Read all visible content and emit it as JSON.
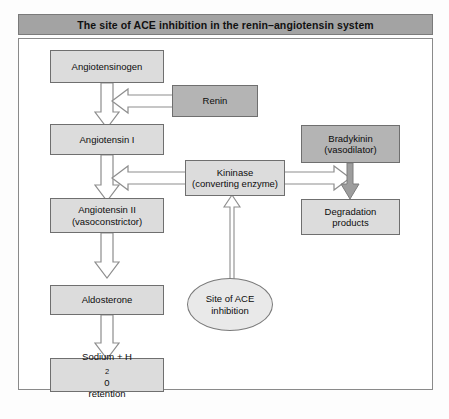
{
  "figure": {
    "title": "The site of ACE inhibition in the renin–angiotensin system",
    "colors": {
      "title_bar": "#a3a3a3",
      "node_light": "#dcdcdc",
      "node_dark": "#b4b4b4",
      "ellipse_fill": "#e9e9e9",
      "arrow_outline": "#8d8d8d",
      "arrow_fill": "#ffffff",
      "border": "#6f6f6f",
      "frame": "#8a8a8a",
      "text": "#0c0c0c"
    }
  },
  "nodes": {
    "angiotensinogen": {
      "label": "Angiotensinogen"
    },
    "renin": {
      "label": "Renin"
    },
    "angiotensin_i": {
      "label": "Angiotensin I"
    },
    "kininase": {
      "line1": "Kininase",
      "line2": "(converting enzyme)"
    },
    "bradykinin": {
      "line1": "Bradykinin",
      "line2": "(vasodilator)"
    },
    "angiotensin_ii": {
      "line1": "Angiotensin II",
      "line2": "(vasoconstrictor)"
    },
    "degradation_products": {
      "line1": "Degradation",
      "line2": "products"
    },
    "aldosterone": {
      "label": "Aldosterone"
    },
    "site_of_ace": {
      "line1": "Site of ACE",
      "line2": "inhibition"
    },
    "sodium_retention": {
      "line1_pre": "Sodium + H",
      "line1_sub": "2",
      "line1_post": "0",
      "line2": "retention"
    }
  },
  "edges": [
    {
      "name": "angiotensinogen-to-angiotensin-i",
      "kind": "block-arrow-down"
    },
    {
      "name": "renin-to-angiotensinogen-arrow",
      "kind": "block-arrow-left"
    },
    {
      "name": "angiotensin-i-to-angiotensin-ii",
      "kind": "block-arrow-down"
    },
    {
      "name": "kininase-to-angiotensin-i",
      "kind": "block-arrow-left"
    },
    {
      "name": "kininase-to-degradation",
      "kind": "block-arrow-right"
    },
    {
      "name": "bradykinin-to-degradation",
      "kind": "solid-arrow-down"
    },
    {
      "name": "site-of-ace-to-kininase",
      "kind": "thin-arrow-up"
    },
    {
      "name": "angiotensin-ii-to-aldosterone",
      "kind": "block-arrow-down"
    },
    {
      "name": "aldosterone-to-sodium-retention",
      "kind": "block-arrow-down"
    }
  ]
}
